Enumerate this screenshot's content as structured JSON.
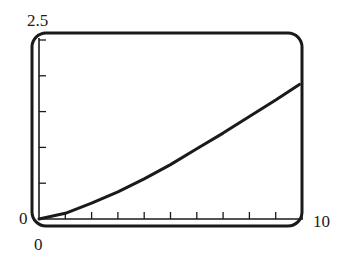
{
  "chart_data": {
    "type": "line",
    "title": "",
    "xlabel": "",
    "ylabel": "",
    "xlim": [
      0,
      10
    ],
    "ylim": [
      0,
      2.5
    ],
    "x_tick_labels": [
      "0",
      "10"
    ],
    "y_tick_labels": [
      "0",
      "2.5"
    ],
    "x_ticks_count": 10,
    "y_ticks_count": 5,
    "grid": false,
    "legend": null,
    "series": [
      {
        "name": "curve",
        "x": [
          0,
          1,
          2,
          3,
          4,
          5,
          6,
          7,
          8,
          9,
          9.9
        ],
        "y": [
          0,
          0.08,
          0.22,
          0.38,
          0.56,
          0.76,
          0.98,
          1.2,
          1.43,
          1.66,
          1.88
        ]
      }
    ],
    "colors": {
      "line": "#1a1a1a",
      "frame": "#1a1a1a"
    }
  },
  "labels": {
    "y_max": "2.5",
    "y_min": "0",
    "x_min": "0",
    "x_max": "10"
  }
}
